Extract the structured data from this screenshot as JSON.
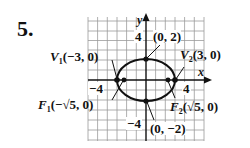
{
  "problem": {
    "number": "5."
  },
  "axes": {
    "x_name": "x",
    "y_name": "y",
    "tick_y_pos": "4",
    "tick_x_neg": "−4",
    "tick_x_pos": "4",
    "tick_y_neg": "−4"
  },
  "points": {
    "v1": {
      "name": "V",
      "sub": "1",
      "coords": "(−3, 0)"
    },
    "v2": {
      "name": "V",
      "sub": "2",
      "coords": "(3, 0)"
    },
    "f1": {
      "name": "F",
      "sub": "1",
      "coords": "(−√5, 0)"
    },
    "f2": {
      "name": "F",
      "sub": "2",
      "coords": "(√5, 0)"
    },
    "top": {
      "coords": "(0, 2)"
    },
    "bottom": {
      "coords": "(0, −2)"
    }
  },
  "colors": {
    "ink": "#111111",
    "grid": "#9a9a9a"
  }
}
